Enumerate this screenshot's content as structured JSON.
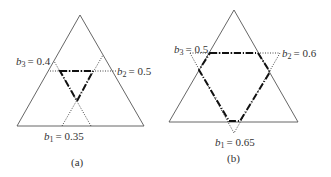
{
  "panels": [
    {
      "id": "a",
      "caption": "(a)",
      "labels": {
        "b1": {
          "var": "b",
          "sub": "1",
          "value": "= 0.35"
        },
        "b2": {
          "var": "b",
          "sub": "2",
          "value": "= 0.5"
        },
        "b3": {
          "var": "b",
          "sub": "3",
          "value": "= 0.4"
        }
      }
    },
    {
      "id": "b",
      "caption": "(b)",
      "labels": {
        "b1": {
          "var": "b",
          "sub": "1",
          "value": "= 0.65"
        },
        "b2": {
          "var": "b",
          "sub": "2",
          "value": "= 0.6"
        },
        "b3": {
          "var": "b",
          "sub": "3",
          "value": "= 0.5"
        }
      }
    }
  ],
  "colors": {
    "outline": "#555555",
    "dotted": "#444444",
    "region": "#111111"
  }
}
